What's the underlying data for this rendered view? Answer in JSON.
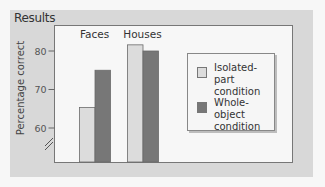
{
  "panel": {
    "title": "Results"
  },
  "chart_data": {
    "type": "bar",
    "title": "Results",
    "categories": [
      "Faces",
      "Houses"
    ],
    "series": [
      {
        "name": "Isolated-part condition",
        "color": "#dcdcdc",
        "values": [
          65.3,
          81.6
        ]
      },
      {
        "name": "Whole-object condition",
        "color": "#777777",
        "values": [
          75,
          80
        ]
      }
    ],
    "xlabel": "",
    "ylabel": "Percentage correct",
    "yticks": [
      60,
      70,
      80
    ],
    "ytick_labels": [
      "60",
      "70",
      "80"
    ],
    "ylim": [
      53,
      87
    ],
    "axis_break": true,
    "grid": false,
    "legend": {
      "position": "right",
      "entries": [
        {
          "line1": "Isolated-part",
          "line2": "condition",
          "color": "#dcdcdc"
        },
        {
          "line1": "Whole-object",
          "line2": "condition",
          "color": "#777777"
        }
      ]
    }
  }
}
